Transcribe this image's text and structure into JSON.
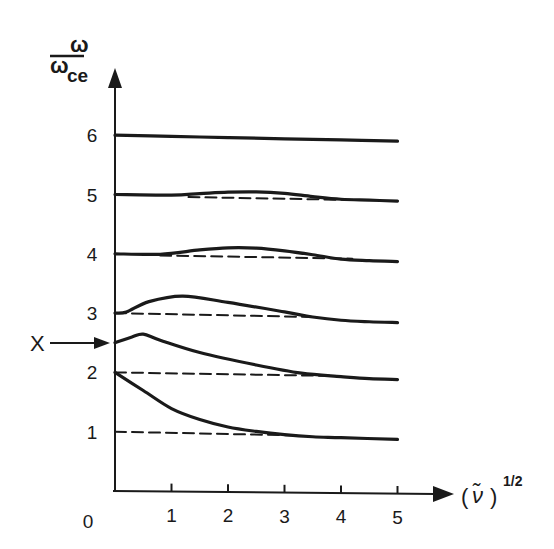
{
  "chart_data": {
    "type": "line",
    "title": "",
    "xlabel": "(ν̃)^1/2",
    "xlabel_parts": {
      "open": "(",
      "symbol": "ν̃",
      "close": ")",
      "sup": "1/2"
    },
    "ylabel": "ω / ω_ce",
    "ylabel_parts": {
      "num": "ω",
      "den": "ω",
      "den_sub": "ce"
    },
    "xlim": [
      0,
      5.8
    ],
    "ylim": [
      0,
      7.2
    ],
    "x_ticks": [
      1,
      2,
      3,
      4,
      5
    ],
    "x_tick_labels": [
      "1",
      "2",
      "3",
      "4",
      "5"
    ],
    "y_ticks": [
      0,
      1,
      2,
      3,
      4,
      5,
      6
    ],
    "y_tick_labels": [
      "0",
      "1",
      "2",
      "3",
      "4",
      "5",
      "6"
    ],
    "grid": false,
    "legend": null,
    "annotation": {
      "label": "X",
      "points_to_y": 2.5,
      "description": "arrow pointing to starting value of the branch between 2 and 3"
    },
    "series": [
      {
        "name": "branch-6",
        "style": "solid",
        "x": [
          0,
          1,
          2,
          3,
          4,
          5
        ],
        "y": [
          6.0,
          5.99,
          5.98,
          5.97,
          5.96,
          5.95
        ]
      },
      {
        "name": "branch-5",
        "style": "solid",
        "x": [
          0,
          1,
          1.5,
          2,
          2.5,
          3,
          3.5,
          4,
          4.5,
          5
        ],
        "y": [
          5.0,
          5.0,
          5.03,
          5.06,
          5.07,
          5.05,
          5.0,
          4.96,
          4.95,
          4.94
        ]
      },
      {
        "name": "branch-5-asymptote",
        "style": "dashed",
        "x": [
          1.3,
          4.3
        ],
        "y": [
          4.97,
          4.95
        ]
      },
      {
        "name": "branch-4",
        "style": "solid",
        "x": [
          0,
          0.8,
          1.5,
          2,
          2.5,
          3,
          3.5,
          4,
          4.5,
          5
        ],
        "y": [
          4.0,
          4.0,
          4.08,
          4.12,
          4.12,
          4.08,
          4.02,
          3.95,
          3.93,
          3.92
        ]
      },
      {
        "name": "branch-4-asymptote",
        "style": "dashed",
        "x": [
          0.8,
          4.2
        ],
        "y": [
          3.98,
          3.96
        ]
      },
      {
        "name": "branch-3",
        "style": "solid",
        "x": [
          0,
          0.2,
          0.6,
          1.2,
          2,
          3,
          3.5,
          4,
          4.5,
          5
        ],
        "y": [
          3.0,
          3.02,
          3.2,
          3.3,
          3.2,
          3.05,
          2.97,
          2.92,
          2.9,
          2.89
        ]
      },
      {
        "name": "branch-3-asymptote",
        "style": "dashed",
        "x": [
          0,
          3.5
        ],
        "y": [
          3.0,
          2.97
        ]
      },
      {
        "name": "branch-2-3",
        "style": "solid",
        "x": [
          0,
          0.3,
          0.5,
          0.8,
          1.5,
          2.5,
          3.3,
          4,
          4.5,
          5
        ],
        "y": [
          2.5,
          2.6,
          2.65,
          2.55,
          2.35,
          2.15,
          2.02,
          1.97,
          1.94,
          1.93
        ]
      },
      {
        "name": "branch-2-asymptote",
        "style": "dashed",
        "x": [
          0,
          3.8
        ],
        "y": [
          2.0,
          1.98
        ]
      },
      {
        "name": "branch-1-2",
        "style": "solid",
        "x": [
          0,
          0.5,
          1,
          1.5,
          2,
          2.5,
          3,
          3.5,
          4,
          5
        ],
        "y": [
          2.0,
          1.7,
          1.4,
          1.22,
          1.1,
          1.03,
          0.98,
          0.95,
          0.94,
          0.92
        ]
      },
      {
        "name": "branch-1-asymptote",
        "style": "dashed",
        "x": [
          0,
          3.2
        ],
        "y": [
          1.0,
          0.97
        ]
      }
    ]
  },
  "colors": {
    "ink": "#1a1a1a",
    "background": "#ffffff"
  }
}
